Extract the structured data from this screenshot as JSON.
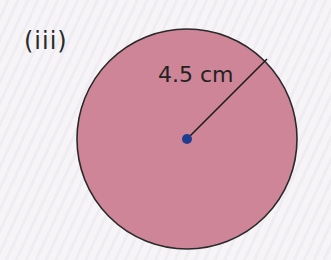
{
  "label": "(iii)",
  "circle": {
    "radius_label": "4.5 cm",
    "fill_color": "#cf8598",
    "stroke_color": "#2a2a2a",
    "center_dot_color": "#1f3d8f"
  }
}
